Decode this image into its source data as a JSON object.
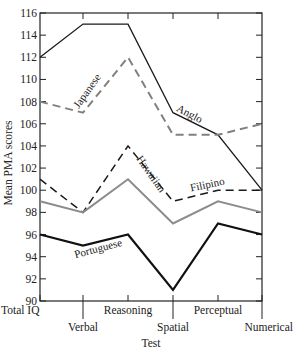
{
  "chart_data": {
    "type": "line",
    "title": "",
    "xlabel": "Test",
    "ylabel": "Mean PMA scores",
    "ylim": [
      90,
      116
    ],
    "yticks": [
      90,
      92,
      94,
      96,
      98,
      100,
      102,
      104,
      106,
      108,
      110,
      112,
      114,
      116
    ],
    "categories": [
      "Total IQ",
      "Verbal",
      "Reasoning",
      "Spatial",
      "Perceptual",
      "Numerical"
    ],
    "grid": false,
    "legend": "inline labels on lines",
    "series": [
      {
        "name": "Anglo",
        "style": "solid-thin",
        "color": "#1a1a1a",
        "values": [
          112,
          115,
          115,
          107,
          105,
          100
        ]
      },
      {
        "name": "Japanese",
        "style": "dashed",
        "color": "#808080",
        "values": [
          108,
          107,
          112,
          105,
          105,
          106
        ]
      },
      {
        "name": "Filipino",
        "style": "dashed",
        "color": "#1a1a1a",
        "values": [
          101,
          98,
          104,
          99,
          100,
          100
        ]
      },
      {
        "name": "Hawaiian",
        "style": "solid",
        "color": "#8c8c8c",
        "values": [
          99,
          98,
          101,
          97,
          99,
          98
        ]
      },
      {
        "name": "Portuguese",
        "style": "solid-thick",
        "color": "#111111",
        "values": [
          96,
          95,
          96,
          91,
          97,
          96
        ]
      }
    ]
  }
}
